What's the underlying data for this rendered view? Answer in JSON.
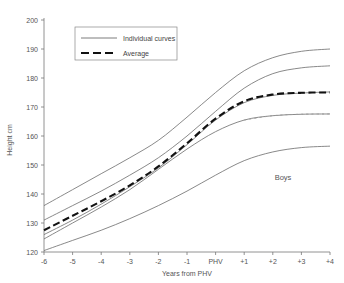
{
  "chart_data": {
    "type": "line",
    "title": "",
    "xlabel": "Years from PHV",
    "ylabel": "Height cm",
    "annotation": "Boys",
    "grid": false,
    "legend_position": "top-left",
    "xlim": [
      -6,
      4
    ],
    "ylim": [
      120,
      200
    ],
    "x_tick_labels": [
      "-6",
      "-5",
      "-4",
      "-3",
      "-2",
      "-1",
      "PHV",
      "+1",
      "+2",
      "+3",
      "+4"
    ],
    "x_tick_values": [
      -6,
      -5,
      -4,
      -3,
      -2,
      -1,
      0,
      1,
      2,
      3,
      4
    ],
    "y_tick_labels": [
      "120",
      "130",
      "140",
      "150",
      "160",
      "170",
      "180",
      "190",
      "200"
    ],
    "y_tick_values": [
      120,
      130,
      140,
      150,
      160,
      170,
      180,
      190,
      200
    ],
    "legend": [
      {
        "label": "Individual curves",
        "style": "solid",
        "color": "#5a5a5a"
      },
      {
        "label": "Average",
        "style": "dashed",
        "color": "#111111"
      }
    ],
    "x": [
      -6,
      -5,
      -4,
      -3,
      -2,
      -1,
      0,
      1,
      2,
      3,
      4
    ],
    "series": [
      {
        "name": "Individual curve 1",
        "style": "solid",
        "color": "#6b6b6b",
        "values": [
          136.0,
          141.5,
          147.0,
          152.5,
          158.5,
          166.5,
          175.0,
          182.5,
          187.0,
          189.2,
          190.0
        ]
      },
      {
        "name": "Individual curve 2",
        "style": "solid",
        "color": "#6b6b6b",
        "values": [
          131.0,
          136.0,
          141.0,
          146.5,
          152.5,
          160.0,
          168.5,
          176.5,
          181.5,
          183.5,
          184.2
        ]
      },
      {
        "name": "Individual curve 3",
        "style": "solid",
        "color": "#6b6b6b",
        "values": [
          126.0,
          131.0,
          136.5,
          142.5,
          149.0,
          157.0,
          165.5,
          171.5,
          174.0,
          174.8,
          175.2
        ]
      },
      {
        "name": "Individual curve 4",
        "style": "solid-then-dotted",
        "color": "#6b6b6b",
        "values": [
          124.5,
          130.0,
          135.5,
          141.5,
          148.5,
          155.5,
          161.5,
          165.5,
          167.0,
          167.5,
          167.6
        ]
      },
      {
        "name": "Individual curve 5",
        "style": "solid",
        "color": "#6b6b6b",
        "values": [
          120.5,
          124.0,
          127.5,
          131.5,
          136.0,
          141.0,
          146.5,
          151.5,
          154.5,
          156.0,
          156.5
        ]
      },
      {
        "name": "Average",
        "style": "dashed",
        "color": "#111111",
        "values": [
          127.5,
          132.5,
          137.5,
          143.0,
          149.5,
          157.5,
          166.0,
          172.0,
          174.3,
          174.9,
          175.0
        ]
      }
    ]
  },
  "axes": {
    "x_axis_name": "x-axis",
    "y_axis_name": "y-axis"
  }
}
